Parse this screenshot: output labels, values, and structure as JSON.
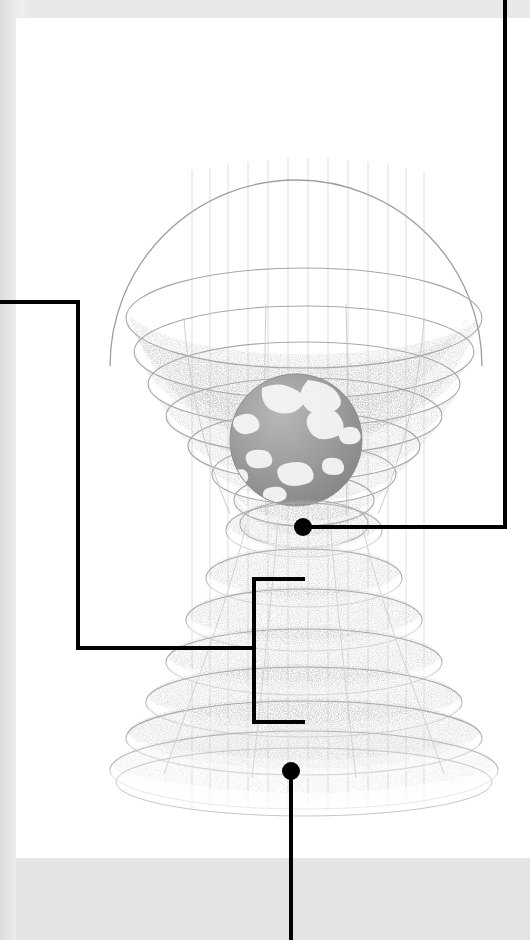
{
  "page": {
    "kind": "printed-diagram-page",
    "width": 530,
    "height": 940,
    "paper_color": "#ffffff",
    "margin_color": "#e6e6e6",
    "ink_color": "#000000",
    "sheet": {
      "left": 16,
      "top": 18,
      "width": 514,
      "height": 840
    }
  },
  "figure": {
    "globe": {
      "center_x": 296,
      "center_y": 440,
      "radius": 66,
      "fill": "#9a9a9a",
      "landmass_color": "#f2f2f2"
    },
    "upper_dome": {
      "apex_y": 34,
      "base_y": 360,
      "center_x": 296,
      "max_radius": 186,
      "ring_count": 7,
      "ring_y": [
        160,
        196,
        230,
        262,
        292,
        322,
        352
      ],
      "ring_radius": [
        178,
        166,
        152,
        136,
        118,
        100,
        82
      ]
    },
    "lower_dome": {
      "top_y": 500,
      "base_y": 775,
      "center_x": 296,
      "max_radius": 186,
      "ring_count": 7,
      "ring_y": [
        514,
        560,
        600,
        638,
        672,
        706,
        742
      ],
      "ring_radius": [
        84,
        104,
        124,
        144,
        162,
        178,
        190
      ]
    },
    "meridian_threads": {
      "count": 13,
      "top_y": 150,
      "bottom_y": 790,
      "color": "#dddddd"
    },
    "shading": {
      "stipple_color": "#8c8c8c",
      "outline_color": "#b4b4b4"
    }
  },
  "callouts": [
    {
      "id": "callout-right",
      "label": "right-leader",
      "node": {
        "x": 303,
        "y": 527,
        "r": 9
      },
      "path": "M303,527 L505,527 L505,0",
      "exits_edge": "top-right",
      "stroke_width": 4
    },
    {
      "id": "callout-left",
      "label": "left-leader",
      "node": null,
      "path": "M0,302 L78,302 L78,648 L255,648",
      "exits_edge": "left",
      "stroke_width": 4
    },
    {
      "id": "callout-bracket",
      "label": "bracket-leader",
      "node": null,
      "path": "M305,579 L254,579 L254,722 L305,722",
      "exits_edge": "none",
      "stroke_width": 4
    },
    {
      "id": "callout-bottom",
      "label": "bottom-leader",
      "node": {
        "x": 291,
        "y": 771,
        "r": 9
      },
      "path": "M291,771 L291,940",
      "exits_edge": "bottom",
      "stroke_width": 4
    }
  ],
  "labels": {
    "visible_text": []
  }
}
